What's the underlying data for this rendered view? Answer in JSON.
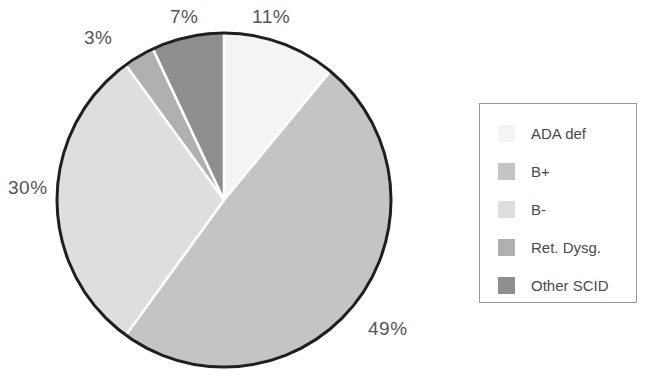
{
  "chart_data": {
    "type": "pie",
    "title": "",
    "categories": [
      "ADA def",
      "B+",
      "B-",
      "Ret. Dysg.",
      "Other SCID"
    ],
    "values": [
      11,
      49,
      30,
      3,
      7
    ],
    "value_labels": [
      "11%",
      "49%",
      "30%",
      "3%",
      "7%"
    ],
    "units": "percent",
    "start_angle_deg": 0,
    "direction": "clockwise",
    "legend_position": "right",
    "grid": false,
    "colors": [
      "#f4f4f4",
      "#c4c4c4",
      "#dedede",
      "#b0b0b0",
      "#8f8f8f"
    ],
    "outline_color": "#1f1f1f",
    "separator_color": "#ffffff",
    "slices": [
      {
        "label": "ADA def",
        "value": 11,
        "display": "11%",
        "color": "#f4f4f4"
      },
      {
        "label": "B+",
        "value": 49,
        "display": "49%",
        "color": "#c4c4c4"
      },
      {
        "label": "B-",
        "value": 30,
        "display": "30%",
        "color": "#dedede"
      },
      {
        "label": "Ret. Dysg.",
        "value": 3,
        "display": "3%",
        "color": "#b0b0b0"
      },
      {
        "label": "Other SCID",
        "value": 7,
        "display": "7%",
        "color": "#8f8f8f"
      }
    ]
  },
  "labels": {
    "ada": "11%",
    "bplus": "49%",
    "bminus": "30%",
    "ret": "3%",
    "other": "7%"
  },
  "legend": {
    "items": [
      {
        "label": "ADA def",
        "color": "#f4f4f4"
      },
      {
        "label": "B+",
        "color": "#c4c4c4"
      },
      {
        "label": "B-",
        "color": "#dedede"
      },
      {
        "label": "Ret. Dysg.",
        "color": "#b0b0b0"
      },
      {
        "label": "Other SCID",
        "color": "#8f8f8f"
      }
    ]
  }
}
